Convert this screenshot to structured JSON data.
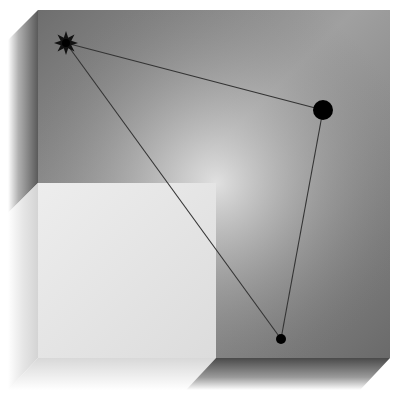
{
  "figure": {
    "colors": {
      "background": "#ffffff",
      "face_dark_top": "#7a7a7a",
      "face_dark_bottom": "#8e8e8e",
      "highlight": "#d8d8d8",
      "light_square": "#e4e4e4",
      "bevel_dark": "#555555",
      "line": "#333333",
      "marker": "#000000"
    },
    "face": {
      "x": 38,
      "y": 10,
      "width": 352,
      "height": 348
    },
    "light_square": {
      "x": 38,
      "y": 183,
      "width": 178,
      "height": 175
    },
    "triangle": {
      "vertices": [
        {
          "name": "star",
          "x": 66,
          "y": 43
        },
        {
          "name": "large-dot",
          "x": 323,
          "y": 110,
          "r": 10
        },
        {
          "name": "small-dot",
          "x": 281,
          "y": 339,
          "r": 5
        }
      ]
    }
  }
}
